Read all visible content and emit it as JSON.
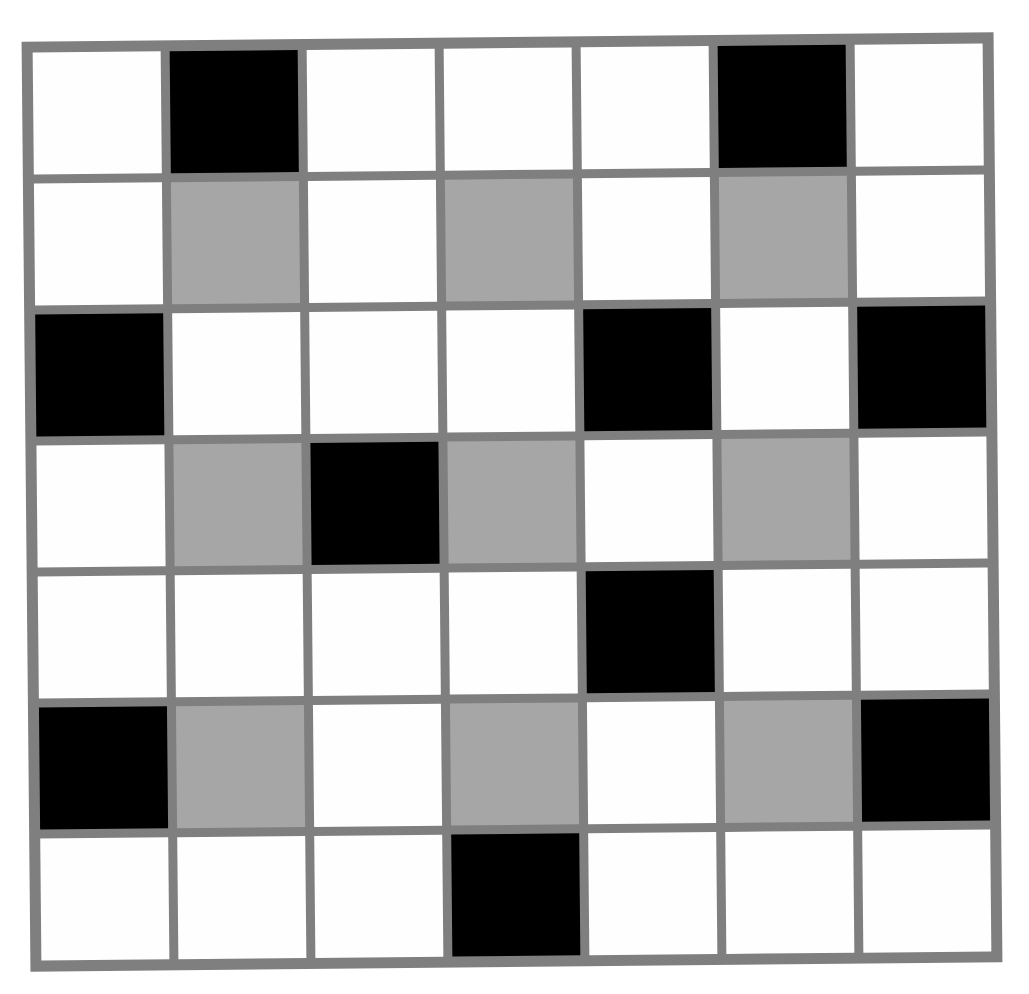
{
  "diagram": {
    "type": "grid-pattern",
    "rows": 7,
    "cols": 7,
    "colors": {
      "frame": "#7f7f7f",
      "black": "#000000",
      "gray": "#a6a6a6",
      "white": "#fefefe"
    },
    "cells": [
      [
        "white",
        "black",
        "white",
        "white",
        "white",
        "black",
        "white"
      ],
      [
        "white",
        "gray",
        "white",
        "gray",
        "white",
        "gray",
        "white"
      ],
      [
        "black",
        "white",
        "white",
        "white",
        "black",
        "white",
        "black"
      ],
      [
        "white",
        "gray",
        "black",
        "gray",
        "white",
        "gray",
        "white"
      ],
      [
        "white",
        "white",
        "white",
        "white",
        "black",
        "white",
        "white"
      ],
      [
        "black",
        "gray",
        "white",
        "gray",
        "white",
        "gray",
        "black"
      ],
      [
        "white",
        "white",
        "white",
        "black",
        "white",
        "white",
        "white"
      ]
    ]
  }
}
